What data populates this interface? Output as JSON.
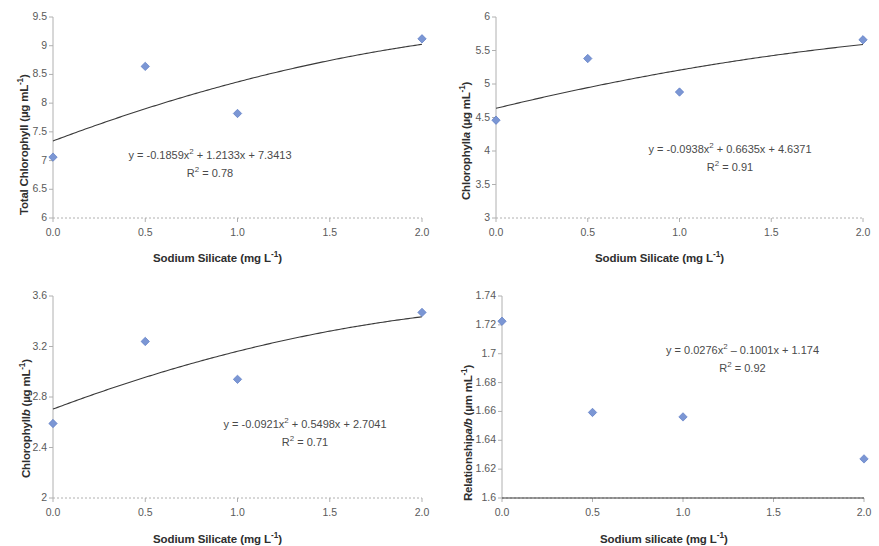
{
  "figure": {
    "background": "#ffffff",
    "marker_color": "#7b96d4",
    "marker_edge": "#5b7bc4",
    "curve_color": "#3a3a3a",
    "axis_color": "#b0b0b0",
    "text_color": "#4a4a4a"
  },
  "panels": [
    {
      "id": "total-chlorophyll",
      "ytitle_prefix": "Total Chlorophyll (µg mL",
      "ytitle_sup": "-1",
      "ytitle_suffix": ")",
      "xtitle_prefix": "Sodium Silicate (mg L",
      "xtitle_sup": "-1",
      "xtitle_suffix": ")",
      "equation_prefix": "y = -0.1859x",
      "equation_sup": "2",
      "equation_suffix": " + 1.2133x + 7.3413",
      "r2_prefix": "R",
      "r2_sup": "2",
      "r2_suffix": " = 0.78"
    },
    {
      "id": "chlorophyll-a",
      "ytitle_prefix": "Chlorophyll",
      "ytitle_italic": "a",
      "ytitle_mid": " (µg mL",
      "ytitle_sup": "-1",
      "ytitle_suffix": ")",
      "xtitle_prefix": "Sodium Silicate (mg L",
      "xtitle_sup": "-1",
      "xtitle_suffix": ")",
      "equation_prefix": "y = -0.0938x",
      "equation_sup": "2",
      "equation_suffix": " + 0.6635x + 4.6371",
      "r2_prefix": "R",
      "r2_sup": "2",
      "r2_suffix": " = 0.91"
    },
    {
      "id": "chlorophyll-b",
      "ytitle_prefix": "Chlorophyll",
      "ytitle_italic": "b",
      "ytitle_mid": " (µg mL",
      "ytitle_sup": "-1",
      "ytitle_suffix": ")",
      "xtitle_prefix": "Sodium Silicate (mg L",
      "xtitle_sup": "-1",
      "xtitle_suffix": ")",
      "equation_prefix": "y = -0.0921x",
      "equation_sup": "2",
      "equation_suffix": " + 0.5498x + 2.7041",
      "r2_prefix": "R",
      "r2_sup": "2",
      "r2_suffix": " = 0.71"
    },
    {
      "id": "relationship-a-b",
      "ytitle_prefix": "Relationship",
      "ytitle_italic": "a/b",
      "ytitle_mid": " (µm mL",
      "ytitle_sup": "-1",
      "ytitle_suffix": ")",
      "xtitle_prefix": "Sodium silicate (mg L",
      "xtitle_sup": "-1",
      "xtitle_suffix": ")",
      "equation_prefix": "y = 0.0276x",
      "equation_sup": "2",
      "equation_suffix": " – 0.1001x + 1.174",
      "r2_prefix": "R",
      "r2_sup": "2",
      "r2_suffix": " = 0.92"
    }
  ],
  "chart_data": [
    {
      "type": "scatter",
      "panel": "top-left",
      "title": "",
      "xlabel": "Sodium Silicate (mg L-1)",
      "ylabel": "Total Chlorophyll (µg mL-1)",
      "xlim": [
        0,
        2
      ],
      "ylim": [
        6,
        9.5
      ],
      "xticks": [
        0,
        0.5,
        1,
        1.5,
        2
      ],
      "xtick_labels": [
        "0.0",
        "0.5",
        "1.0",
        "1.5",
        "2.0"
      ],
      "yticks": [
        6,
        6.5,
        7,
        7.5,
        8,
        8.5,
        9,
        9.5
      ],
      "ytick_labels": [
        "6",
        "6.5",
        "7",
        "7.5",
        "8",
        "8.5",
        "9",
        "9.5"
      ],
      "grid": false,
      "legend": "none",
      "x": [
        0,
        0.5,
        1,
        2
      ],
      "y": [
        7.06,
        8.64,
        7.82,
        9.12
      ],
      "fit": {
        "kind": "polynomial",
        "degree": 2,
        "a": -0.1859,
        "b": 1.2133,
        "c": 7.3413,
        "r2": 0.78,
        "equation": "y = -0.1859x2 + 1.2133x + 7.3413"
      }
    },
    {
      "type": "scatter",
      "panel": "top-right",
      "title": "",
      "xlabel": "Sodium Silicate (mg L-1)",
      "ylabel": "Chlorophyll a (µg mL-1)",
      "xlim": [
        0,
        2
      ],
      "ylim": [
        3,
        6
      ],
      "xticks": [
        0,
        0.5,
        1,
        1.5,
        2
      ],
      "xtick_labels": [
        "0.0",
        "0.5",
        "1.0",
        "1.5",
        "2.0"
      ],
      "yticks": [
        3,
        3.5,
        4,
        4.5,
        5,
        5.5,
        6
      ],
      "ytick_labels": [
        "3",
        "3.5",
        "4",
        "4.5",
        "5",
        "5.5",
        "6"
      ],
      "grid": false,
      "legend": "none",
      "x": [
        0,
        0.5,
        1,
        2
      ],
      "y": [
        4.46,
        5.38,
        4.88,
        5.66
      ],
      "fit": {
        "kind": "polynomial",
        "degree": 2,
        "a": -0.0938,
        "b": 0.6635,
        "c": 4.6371,
        "r2": 0.91,
        "equation": "y = -0.0938x2 + 0.6635x + 4.6371"
      }
    },
    {
      "type": "scatter",
      "panel": "bottom-left",
      "title": "",
      "xlabel": "Sodium Silicate (mg L-1)",
      "ylabel": "Chlorophyll b (µg mL-1)",
      "xlim": [
        0,
        2
      ],
      "ylim": [
        2,
        3.6
      ],
      "xticks": [
        0,
        0.5,
        1,
        1.5,
        2
      ],
      "xtick_labels": [
        "0.0",
        "0.5",
        "1.0",
        "1.5",
        "2.0"
      ],
      "yticks": [
        2,
        2.4,
        2.8,
        3.2,
        3.6
      ],
      "ytick_labels": [
        "2",
        "2.4",
        "2.8",
        "3.2",
        "3.6"
      ],
      "grid": false,
      "legend": "none",
      "x": [
        0,
        0.5,
        1,
        2
      ],
      "y": [
        2.59,
        3.24,
        2.94,
        3.47
      ],
      "fit": {
        "kind": "polynomial",
        "degree": 2,
        "a": -0.0921,
        "b": 0.5498,
        "c": 2.7041,
        "r2": 0.71,
        "equation": "y = -0.0921x2 + 0.5498x + 2.7041"
      }
    },
    {
      "type": "scatter",
      "panel": "bottom-right",
      "title": "",
      "xlabel": "Sodium silicate (mg L-1)",
      "ylabel": "Relationship a/b (µm mL-1)",
      "xlim": [
        0,
        2
      ],
      "ylim": [
        1.6,
        1.74
      ],
      "xticks": [
        0,
        0.5,
        1,
        1.5,
        2
      ],
      "xtick_labels": [
        "0.0",
        "0.5",
        "1.0",
        "1.5",
        "2.0"
      ],
      "yticks": [
        1.6,
        1.62,
        1.64,
        1.66,
        1.68,
        1.7,
        1.72,
        1.74
      ],
      "ytick_labels": [
        "1.6",
        "1.62",
        "1.64",
        "1.66",
        "1.68",
        "1.7",
        "1.72",
        "1.74"
      ],
      "grid": false,
      "legend": "none",
      "x": [
        0,
        0.5,
        1,
        2
      ],
      "y": [
        1.7225,
        1.6593,
        1.6562,
        1.6271
      ],
      "fit": {
        "kind": "polynomial",
        "degree": 2,
        "a": 0.0276,
        "b": -0.1001,
        "c": 1.174,
        "r2": 0.92,
        "equation": "y = 0.0276x2 - 0.1001x + 1.174",
        "note": "curve drawn offset to data range"
      }
    }
  ]
}
